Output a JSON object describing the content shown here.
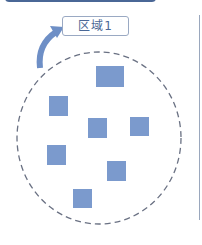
{
  "diagram": {
    "label": "区域1",
    "colors": {
      "banner": "#4a6796",
      "square_fill": "#7b9acd",
      "arrow": "#6e8fc6",
      "ellipse_stroke": "#6a7183",
      "label_border": "#9aa9c3",
      "label_text": "#4a6796"
    },
    "squares": [
      {
        "x": 96,
        "y": 66,
        "w": 28,
        "h": 21
      },
      {
        "x": 49,
        "y": 96,
        "w": 19,
        "h": 20
      },
      {
        "x": 88,
        "y": 118,
        "w": 19,
        "h": 20
      },
      {
        "x": 130,
        "y": 117,
        "w": 19,
        "h": 19
      },
      {
        "x": 47,
        "y": 145,
        "w": 19,
        "h": 20
      },
      {
        "x": 107,
        "y": 161,
        "w": 19,
        "h": 20
      },
      {
        "x": 73,
        "y": 189,
        "w": 19,
        "h": 19
      }
    ]
  }
}
